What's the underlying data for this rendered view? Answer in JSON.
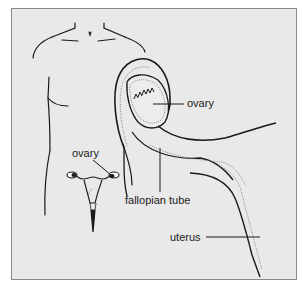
{
  "figure": {
    "type": "anatomical illustration",
    "labels": {
      "ovary_closeup": "ovary",
      "ovary_small": "ovary",
      "fallopian_tube": "fallopian tube",
      "uterus": "uterus"
    },
    "colors": {
      "background": "#e9e9e9",
      "border": "#8a8a8a",
      "line": "#1a1a1a",
      "stipple": "#777777"
    }
  }
}
